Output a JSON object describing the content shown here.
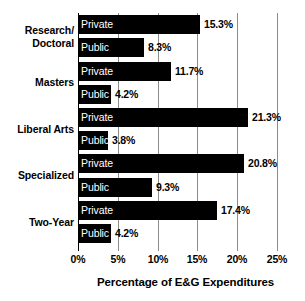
{
  "chart_data": {
    "type": "bar",
    "orientation": "horizontal",
    "title": "",
    "xlabel": "Percentage of E&G Expenditures",
    "ylabel": "",
    "xlim": [
      0,
      25
    ],
    "xunit": "%",
    "grid": true,
    "legend": "none",
    "xticks": [
      "0%",
      "5%",
      "10%",
      "15%",
      "20%",
      "25%"
    ],
    "xtick_values": [
      0,
      5,
      10,
      15,
      20,
      25
    ],
    "categories": [
      "Research/\nDoctoral",
      "Masters",
      "Liberal Arts",
      "Specialized",
      "Two-Year"
    ],
    "series": [
      {
        "name": "Private",
        "values": [
          15.3,
          11.7,
          21.3,
          20.8,
          17.4
        ]
      },
      {
        "name": "Public",
        "values": [
          8.3,
          4.2,
          3.8,
          9.3,
          4.2
        ]
      }
    ],
    "bars": [
      {
        "group": "Research/\nDoctoral",
        "sector": "Private",
        "value": 15.3,
        "value_label": "15.3%"
      },
      {
        "group": "Research/\nDoctoral",
        "sector": "Public",
        "value": 8.3,
        "value_label": "8.3%"
      },
      {
        "group": "Masters",
        "sector": "Private",
        "value": 11.7,
        "value_label": "11.7%"
      },
      {
        "group": "Masters",
        "sector": "Public",
        "value": 4.2,
        "value_label": "4.2%"
      },
      {
        "group": "Liberal Arts",
        "sector": "Private",
        "value": 21.3,
        "value_label": "21.3%"
      },
      {
        "group": "Liberal Arts",
        "sector": "Public",
        "value": 3.8,
        "value_label": "3.8%"
      },
      {
        "group": "Specialized",
        "sector": "Private",
        "value": 20.8,
        "value_label": "20.8%"
      },
      {
        "group": "Specialized",
        "sector": "Public",
        "value": 9.3,
        "value_label": "9.3%"
      },
      {
        "group": "Two-Year",
        "sector": "Private",
        "value": 17.4,
        "value_label": "17.4%"
      },
      {
        "group": "Two-Year",
        "sector": "Public",
        "value": 4.2,
        "value_label": "4.2%"
      }
    ],
    "colors": {
      "bar": "#000000",
      "bar_text": "#ffffff",
      "value_text": "#000000",
      "grid": "#8c8c8c",
      "axis": "#000000",
      "background": "#ffffff"
    }
  }
}
